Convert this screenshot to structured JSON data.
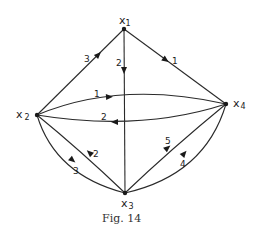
{
  "figure": {
    "caption": "Fig. 14"
  },
  "nodes": [
    {
      "id": "x1",
      "label": "x",
      "subscript": "1"
    },
    {
      "id": "x2",
      "label": "x",
      "subscript": "2"
    },
    {
      "id": "x3",
      "label": "x",
      "subscript": "3"
    },
    {
      "id": "x4",
      "label": "x",
      "subscript": "4"
    }
  ],
  "edges": [
    {
      "from": "x2",
      "to": "x1",
      "weight": "3"
    },
    {
      "from": "x1",
      "to": "x3",
      "weight": "2"
    },
    {
      "from": "x1",
      "to": "x4",
      "weight": "1"
    },
    {
      "from": "x2",
      "to": "x4",
      "weight": "1"
    },
    {
      "from": "x4",
      "to": "x2",
      "weight": "2"
    },
    {
      "from": "x3",
      "to": "x2",
      "weight": "2"
    },
    {
      "from": "x2",
      "to": "x3",
      "weight": "3"
    },
    {
      "from": "x3",
      "to": "x4",
      "weight": "5"
    },
    {
      "from": "x3",
      "to": "x4",
      "weight": "4"
    }
  ]
}
